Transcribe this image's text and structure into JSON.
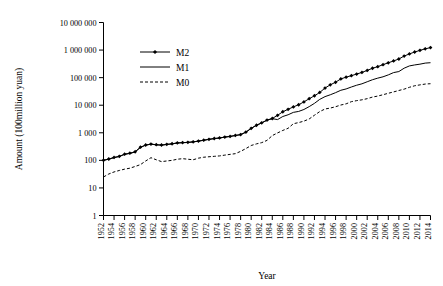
{
  "chart_data": {
    "type": "line",
    "title": "",
    "xlabel": "Year",
    "ylabel": "Amount (100million yuan)",
    "yscale": "log",
    "ylim": [
      1,
      10000000
    ],
    "ytick_labels": [
      "1",
      "10",
      "100",
      "1 000",
      "10 000",
      "100 000",
      "1 000 000",
      "10 000 000"
    ],
    "ytick_values": [
      1,
      10,
      100,
      1000,
      10000,
      100000,
      1000000,
      10000000
    ],
    "grid": false,
    "legend_position": "upper-left-inside",
    "xlim": [
      1952,
      2014
    ],
    "xtick_labels": [
      "1952",
      "1954",
      "1956",
      "1958",
      "1960",
      "1962",
      "1964",
      "1966",
      "1968",
      "1970",
      "1972",
      "1974",
      "1976",
      "1978",
      "1980",
      "1982",
      "1984",
      "1986",
      "1988",
      "1990",
      "1992",
      "1994",
      "1996",
      "1998",
      "2000",
      "2002",
      "2004",
      "2006",
      "2008",
      "2010",
      "2012",
      "2014"
    ],
    "x": [
      1952,
      1953,
      1954,
      1955,
      1956,
      1957,
      1958,
      1959,
      1960,
      1961,
      1962,
      1963,
      1964,
      1965,
      1966,
      1967,
      1968,
      1969,
      1970,
      1971,
      1972,
      1973,
      1974,
      1975,
      1976,
      1977,
      1978,
      1979,
      1980,
      1981,
      1982,
      1983,
      1984,
      1985,
      1986,
      1987,
      1988,
      1989,
      1990,
      1991,
      1992,
      1993,
      1994,
      1995,
      1996,
      1997,
      1998,
      1999,
      2000,
      2001,
      2002,
      2003,
      2004,
      2005,
      2006,
      2007,
      2008,
      2009,
      2010,
      2011,
      2012,
      2013,
      2014
    ],
    "series": [
      {
        "name": "M2",
        "marker": "diamond",
        "style": "solid",
        "color": "#000000",
        "values": [
          101,
          112,
          128,
          140,
          168,
          182,
          205,
          300,
          360,
          390,
          370,
          360,
          380,
          400,
          430,
          440,
          450,
          470,
          500,
          540,
          580,
          620,
          650,
          700,
          740,
          800,
          860,
          1060,
          1450,
          1880,
          2300,
          2900,
          3300,
          4300,
          5800,
          7100,
          8700,
          10400,
          13200,
          17200,
          22000,
          29000,
          42000,
          55000,
          68000,
          90000,
          104000,
          118000,
          135000,
          155000,
          183000,
          219000,
          250000,
          296000,
          345000,
          403000,
          475000,
          606000,
          725000,
          851000,
          975000,
          1106000,
          1228000
        ]
      },
      {
        "name": "M1",
        "marker": "none",
        "style": "solid",
        "color": "#000000",
        "values": [
          100,
          110,
          125,
          138,
          165,
          178,
          200,
          295,
          355,
          385,
          365,
          355,
          375,
          395,
          425,
          435,
          445,
          465,
          495,
          535,
          575,
          615,
          645,
          695,
          735,
          795,
          855,
          1050,
          1440,
          1860,
          2280,
          2850,
          3250,
          3010,
          3900,
          4500,
          5500,
          5950,
          7000,
          8900,
          11700,
          16300,
          20500,
          23900,
          28500,
          34800,
          38900,
          45800,
          53100,
          59800,
          70900,
          84100,
          95900,
          107300,
          126000,
          152500,
          166200,
          220000,
          266000,
          289000,
          308000,
          337000,
          348000
        ]
      },
      {
        "name": "M0",
        "marker": "none",
        "style": "dashed",
        "color": "#000000",
        "values": [
          25,
          32,
          38,
          43,
          48,
          52,
          60,
          70,
          95,
          125,
          105,
          90,
          95,
          100,
          110,
          115,
          110,
          105,
          120,
          130,
          135,
          140,
          145,
          155,
          165,
          175,
          212,
          268,
          346,
          396,
          439,
          530,
          792,
          988,
          1218,
          1454,
          2134,
          2344,
          2644,
          3178,
          4336,
          5865,
          7289,
          7885,
          8802,
          10178,
          11204,
          13456,
          14653,
          15689,
          17278,
          19746,
          21468,
          24032,
          27073,
          30375,
          34219,
          38246,
          44628,
          50748,
          54660,
          58574,
          60260
        ]
      }
    ]
  },
  "legend": {
    "items": [
      {
        "label": "M2"
      },
      {
        "label": "M1"
      },
      {
        "label": "M0"
      }
    ]
  }
}
